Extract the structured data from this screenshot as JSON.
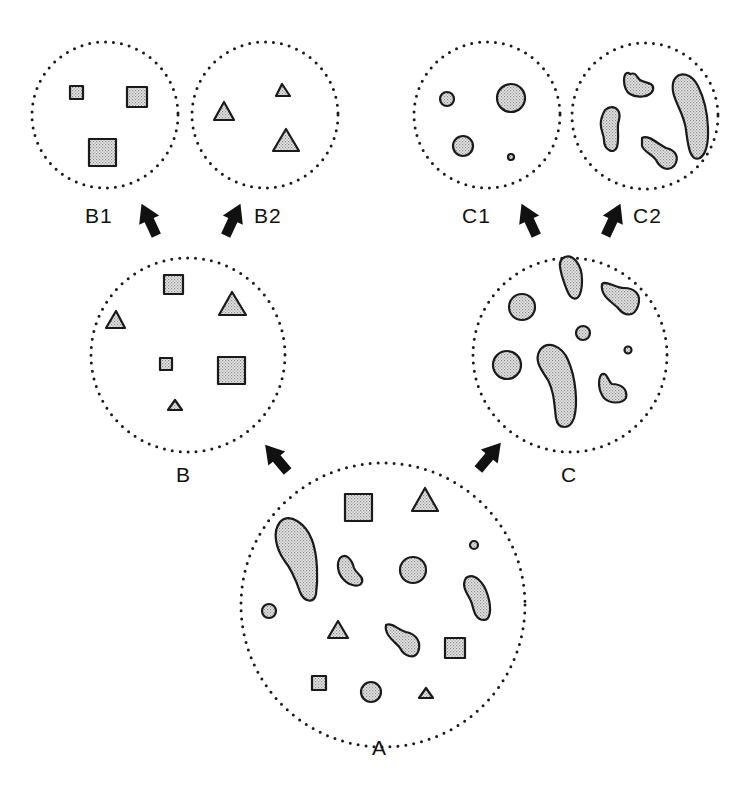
{
  "diagram": {
    "type": "population-split",
    "colors": {
      "stroke": "#1a1a1a",
      "fill": "#d4d4d4",
      "dots": "#1a1a1a",
      "background": "#ffffff"
    },
    "nodes": [
      {
        "id": "A",
        "label": "A",
        "cx": 383,
        "cy": 605,
        "r": 142,
        "label_x": 372,
        "label_y": 755
      },
      {
        "id": "B",
        "label": "B",
        "cx": 188,
        "cy": 355,
        "r": 97,
        "label_x": 176,
        "label_y": 466
      },
      {
        "id": "C",
        "label": "C",
        "cx": 570,
        "cy": 355,
        "r": 97,
        "label_x": 561,
        "label_y": 466
      },
      {
        "id": "B1",
        "label": "B1",
        "cx": 105,
        "cy": 115,
        "r": 73,
        "label_x": 87,
        "label_y": 203
      },
      {
        "id": "B2",
        "label": "B2",
        "cx": 265,
        "cy": 115,
        "r": 73,
        "label_x": 256,
        "label_y": 203
      },
      {
        "id": "C1",
        "label": "C1",
        "cx": 487,
        "cy": 115,
        "r": 73,
        "label_x": 462,
        "label_y": 203
      },
      {
        "id": "C2",
        "label": "C2",
        "cx": 645,
        "cy": 115,
        "r": 73,
        "label_x": 633,
        "label_y": 203
      }
    ],
    "edges": [
      {
        "from": "A",
        "to": "B"
      },
      {
        "from": "A",
        "to": "C"
      },
      {
        "from": "B",
        "to": "B1"
      },
      {
        "from": "B",
        "to": "B2"
      },
      {
        "from": "C",
        "to": "C1"
      },
      {
        "from": "C",
        "to": "C2"
      }
    ],
    "contents": {
      "A": [
        "2 large blobs",
        "2 bean blobs",
        "1 dumbbell blob",
        "3 circles",
        "1 tiny circle",
        "3 squares",
        "3 triangles"
      ],
      "B": [
        "3 squares",
        "3 triangles"
      ],
      "C": [
        "3 circles",
        "1 tiny circle",
        "4 blobs"
      ],
      "B1": [
        "3 squares"
      ],
      "B2": [
        "3 triangles"
      ],
      "C1": [
        "3 circles",
        "1 tiny circle"
      ],
      "C2": [
        "4 blobs"
      ]
    }
  }
}
